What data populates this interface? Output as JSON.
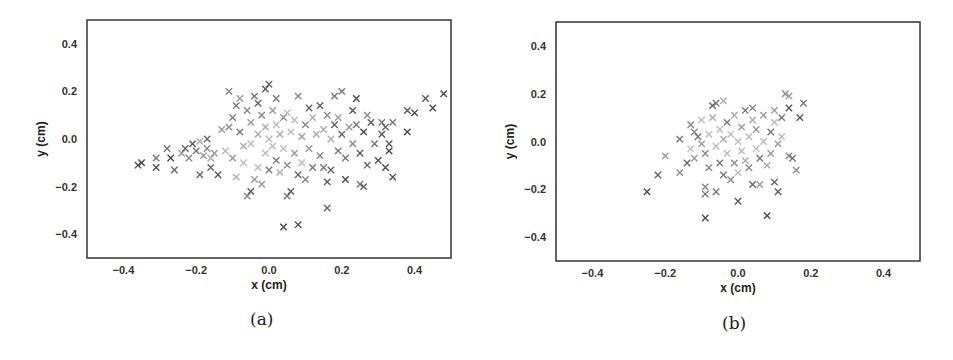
{
  "figure": {
    "captions": [
      "(a)",
      "(b)"
    ]
  },
  "chart_data": [
    {
      "type": "scatter",
      "panel": "(a)",
      "title": "",
      "xlabel": "x (cm)",
      "ylabel": "y (cm)",
      "xlim": [
        -0.5,
        0.5
      ],
      "ylim": [
        -0.5,
        0.5
      ],
      "xticks": [
        "-0.4",
        "-0.2",
        "0.0",
        "0.2",
        "0.4"
      ],
      "yticks": [
        "0.4",
        "0.2",
        "0.0",
        "-0.2",
        "-0.4"
      ],
      "grid": false,
      "marker": "x",
      "colormap": "grayscale",
      "description": "Elongated cloud of x-markers spanning x from about -0.36 to 0.48, y from about -0.37 to 0.24; densest near origin, tail toward left and right",
      "points": [
        [
          -0.36,
          -0.11
        ],
        [
          -0.35,
          -0.1
        ],
        [
          -0.31,
          -0.08
        ],
        [
          -0.31,
          -0.12
        ],
        [
          -0.28,
          -0.04
        ],
        [
          -0.27,
          -0.08
        ],
        [
          -0.26,
          -0.13
        ],
        [
          -0.24,
          -0.06
        ],
        [
          -0.23,
          -0.04
        ],
        [
          -0.22,
          -0.08
        ],
        [
          -0.21,
          -0.02
        ],
        [
          -0.2,
          -0.05
        ],
        [
          -0.19,
          -0.01
        ],
        [
          -0.19,
          -0.15
        ],
        [
          -0.18,
          -0.07
        ],
        [
          -0.17,
          0.0
        ],
        [
          -0.17,
          -0.04
        ],
        [
          -0.16,
          -0.08
        ],
        [
          -0.16,
          -0.12
        ],
        [
          -0.15,
          -0.06
        ],
        [
          -0.14,
          -0.15
        ],
        [
          -0.13,
          0.04
        ],
        [
          -0.12,
          -0.05
        ],
        [
          -0.11,
          0.05
        ],
        [
          -0.11,
          0.2
        ],
        [
          -0.1,
          0.09
        ],
        [
          -0.1,
          -0.08
        ],
        [
          -0.09,
          -0.16
        ],
        [
          -0.09,
          0.14
        ],
        [
          -0.08,
          0.17
        ],
        [
          -0.08,
          0.03
        ],
        [
          -0.07,
          -0.03
        ],
        [
          -0.07,
          -0.1
        ],
        [
          -0.06,
          0.12
        ],
        [
          -0.06,
          -0.24
        ],
        [
          -0.05,
          -0.22
        ],
        [
          -0.05,
          0.07
        ],
        [
          -0.05,
          -0.02
        ],
        [
          -0.04,
          0.18
        ],
        [
          -0.04,
          -0.17
        ],
        [
          -0.03,
          0.15
        ],
        [
          -0.03,
          0.02
        ],
        [
          -0.03,
          -0.12
        ],
        [
          -0.02,
          0.1
        ],
        [
          -0.02,
          -0.19
        ],
        [
          -0.01,
          0.21
        ],
        [
          -0.01,
          0.05
        ],
        [
          -0.01,
          -0.06
        ],
        [
          0.0,
          0.23
        ],
        [
          0.0,
          0.0
        ],
        [
          0.0,
          -0.13
        ],
        [
          0.01,
          0.12
        ],
        [
          0.01,
          -0.03
        ],
        [
          0.02,
          0.17
        ],
        [
          0.02,
          0.06
        ],
        [
          0.02,
          -0.09
        ],
        [
          0.03,
          0.02
        ],
        [
          0.03,
          -0.14
        ],
        [
          0.04,
          0.09
        ],
        [
          0.04,
          -0.04
        ],
        [
          0.04,
          -0.37
        ],
        [
          0.05,
          -0.24
        ],
        [
          0.05,
          0.11
        ],
        [
          0.05,
          -0.11
        ],
        [
          0.06,
          0.03
        ],
        [
          0.06,
          -0.22
        ],
        [
          0.07,
          -0.06
        ],
        [
          0.07,
          0.08
        ],
        [
          0.08,
          -0.36
        ],
        [
          0.08,
          0.18
        ],
        [
          0.08,
          -0.15
        ],
        [
          0.09,
          0.01
        ],
        [
          0.09,
          -0.1
        ],
        [
          0.1,
          0.06
        ],
        [
          0.1,
          -0.17
        ],
        [
          0.11,
          0.13
        ],
        [
          0.11,
          -0.04
        ],
        [
          0.12,
          0.09
        ],
        [
          0.12,
          -0.12
        ],
        [
          0.13,
          0.02
        ],
        [
          0.14,
          0.14
        ],
        [
          0.14,
          -0.07
        ],
        [
          0.15,
          0.04
        ],
        [
          0.15,
          -0.12
        ],
        [
          0.16,
          -0.29
        ],
        [
          0.16,
          -0.18
        ],
        [
          0.16,
          0.1
        ],
        [
          0.17,
          0.0
        ],
        [
          0.17,
          -0.13
        ],
        [
          0.18,
          0.18
        ],
        [
          0.18,
          0.06
        ],
        [
          0.19,
          -0.05
        ],
        [
          0.19,
          0.09
        ],
        [
          0.2,
          0.02
        ],
        [
          0.2,
          0.2
        ],
        [
          0.21,
          -0.17
        ],
        [
          0.21,
          -0.08
        ],
        [
          0.22,
          0.05
        ],
        [
          0.23,
          0.12
        ],
        [
          0.23,
          -0.02
        ],
        [
          0.24,
          0.17
        ],
        [
          0.24,
          0.06
        ],
        [
          0.25,
          -0.19
        ],
        [
          0.25,
          -0.06
        ],
        [
          0.26,
          -0.2
        ],
        [
          0.26,
          0.03
        ],
        [
          0.27,
          -0.11
        ],
        [
          0.27,
          0.1
        ],
        [
          0.28,
          0.07
        ],
        [
          0.29,
          -0.02
        ],
        [
          0.3,
          -0.09
        ],
        [
          0.31,
          0.02
        ],
        [
          0.31,
          0.07
        ],
        [
          0.32,
          -0.12
        ],
        [
          0.32,
          0.05
        ],
        [
          0.33,
          -0.05
        ],
        [
          0.33,
          -0.02
        ],
        [
          0.34,
          0.07
        ],
        [
          0.34,
          -0.16
        ],
        [
          0.38,
          0.12
        ],
        [
          0.38,
          0.03
        ],
        [
          0.4,
          0.11
        ],
        [
          0.43,
          0.17
        ],
        [
          0.45,
          0.13
        ],
        [
          0.48,
          0.19
        ]
      ]
    },
    {
      "type": "scatter",
      "panel": "(b)",
      "title": "",
      "xlabel": "x (cm)",
      "ylabel": "y (cm)",
      "xlim": [
        -0.5,
        0.5
      ],
      "ylim": [
        -0.5,
        0.5
      ],
      "xticks": [
        "-0.4",
        "-0.2",
        "0.0",
        "0.2",
        "0.4"
      ],
      "yticks": [
        "0.4",
        "0.2",
        "0.0",
        "-0.2",
        "-0.4"
      ],
      "grid": false,
      "marker": "x",
      "colormap": "grayscale",
      "description": "Compact roughly elliptical cloud of x-markers centered near origin, x from about -0.25 to 0.18, y from about -0.32 to 0.20",
      "points": [
        [
          -0.25,
          -0.21
        ],
        [
          -0.22,
          -0.14
        ],
        [
          -0.2,
          -0.06
        ],
        [
          -0.16,
          0.01
        ],
        [
          -0.16,
          -0.13
        ],
        [
          -0.14,
          -0.09
        ],
        [
          -0.13,
          0.07
        ],
        [
          -0.13,
          -0.03
        ],
        [
          -0.12,
          0.04
        ],
        [
          -0.12,
          -0.07
        ],
        [
          -0.11,
          0.02
        ],
        [
          -0.1,
          -0.01
        ],
        [
          -0.1,
          0.09
        ],
        [
          -0.09,
          -0.05
        ],
        [
          -0.09,
          -0.19
        ],
        [
          -0.09,
          -0.32
        ],
        [
          -0.09,
          -0.22
        ],
        [
          -0.08,
          0.03
        ],
        [
          -0.08,
          -0.11
        ],
        [
          -0.07,
          0.1
        ],
        [
          -0.07,
          0.15
        ],
        [
          -0.06,
          -0.21
        ],
        [
          -0.06,
          -0.02
        ],
        [
          -0.06,
          0.16
        ],
        [
          -0.05,
          0.05
        ],
        [
          -0.05,
          -0.09
        ],
        [
          -0.04,
          0.01
        ],
        [
          -0.04,
          0.17
        ],
        [
          -0.04,
          -0.14
        ],
        [
          -0.03,
          -0.05
        ],
        [
          -0.03,
          0.08
        ],
        [
          -0.02,
          -0.16
        ],
        [
          -0.02,
          0.03
        ],
        [
          -0.01,
          -0.09
        ],
        [
          -0.01,
          0.11
        ],
        [
          0.0,
          -0.25
        ],
        [
          0.0,
          0.0
        ],
        [
          0.0,
          -0.13
        ],
        [
          0.01,
          0.06
        ],
        [
          0.01,
          -0.04
        ],
        [
          0.02,
          0.13
        ],
        [
          0.02,
          -0.08
        ],
        [
          0.03,
          0.02
        ],
        [
          0.03,
          -0.11
        ],
        [
          0.04,
          0.09
        ],
        [
          0.04,
          -0.18
        ],
        [
          0.04,
          0.14
        ],
        [
          0.05,
          -0.03
        ],
        [
          0.05,
          0.05
        ],
        [
          0.06,
          -0.18
        ],
        [
          0.06,
          -0.07
        ],
        [
          0.07,
          0.11
        ],
        [
          0.07,
          0.0
        ],
        [
          0.08,
          -0.31
        ],
        [
          0.08,
          -0.1
        ],
        [
          0.09,
          0.04
        ],
        [
          0.09,
          -0.05
        ],
        [
          0.1,
          0.08
        ],
        [
          0.1,
          -0.17
        ],
        [
          0.1,
          0.13
        ],
        [
          0.11,
          -0.21
        ],
        [
          0.11,
          -0.01
        ],
        [
          0.12,
          0.02
        ],
        [
          0.12,
          0.1
        ],
        [
          0.13,
          0.2
        ],
        [
          0.14,
          0.14
        ],
        [
          0.14,
          -0.06
        ],
        [
          0.14,
          0.19
        ],
        [
          0.15,
          -0.07
        ],
        [
          0.16,
          -0.12
        ],
        [
          0.17,
          0.1
        ],
        [
          0.18,
          0.16
        ]
      ]
    }
  ]
}
